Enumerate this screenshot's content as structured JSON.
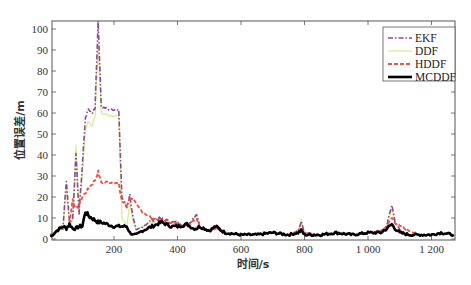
{
  "chart_data": {
    "type": "line",
    "title": "",
    "xlabel": "时间/s",
    "ylabel": "位置误差/m",
    "xlim": [
      0,
      1270
    ],
    "ylim": [
      0,
      104
    ],
    "xticks": [
      200,
      400,
      600,
      800,
      1000,
      1200
    ],
    "xtick_labels": [
      "200",
      "400",
      "600",
      "800",
      "1 000",
      "1 200"
    ],
    "yticks": [
      0,
      10,
      20,
      30,
      40,
      50,
      60,
      70,
      80,
      90,
      100
    ],
    "ytick_labels": [
      "0",
      "10",
      "20",
      "30",
      "40",
      "50",
      "60",
      "70",
      "80",
      "90",
      "100"
    ],
    "grid": false,
    "legend_position": "upper right",
    "x": [
      0,
      20,
      40,
      50,
      60,
      70,
      80,
      90,
      100,
      110,
      120,
      130,
      140,
      150,
      160,
      180,
      200,
      215,
      225,
      240,
      250,
      260,
      270,
      290,
      320,
      350,
      380,
      400,
      430,
      450,
      460,
      470,
      500,
      520,
      550,
      600,
      650,
      700,
      750,
      780,
      790,
      800,
      850,
      900,
      950,
      1000,
      1040,
      1060,
      1075,
      1085,
      1100,
      1130,
      1160,
      1200,
      1230,
      1270
    ],
    "series": [
      {
        "name": "EKF",
        "color": "#8e4a93",
        "style": "dash-dot",
        "values": [
          2,
          4,
          7,
          28,
          8,
          10,
          40,
          12,
          35,
          58,
          62,
          60,
          62,
          104,
          63,
          62,
          62,
          61,
          20,
          15,
          21,
          10,
          4,
          6,
          9,
          10,
          8,
          8,
          6,
          10,
          12,
          6,
          4,
          5,
          3,
          2,
          2,
          3,
          2,
          4,
          8,
          3,
          2,
          3,
          2,
          3,
          3,
          7,
          16,
          9,
          4,
          2,
          2,
          2,
          3,
          2
        ]
      },
      {
        "name": "DDF",
        "color": "#d9ec9a",
        "style": "solid",
        "values": [
          2,
          4,
          6,
          24,
          6,
          9,
          44,
          14,
          30,
          52,
          56,
          54,
          58,
          92,
          60,
          59,
          59,
          58,
          10,
          6,
          18,
          8,
          4,
          6,
          8,
          9,
          8,
          7,
          6,
          10,
          12,
          6,
          4,
          5,
          3,
          2,
          2,
          3,
          2,
          4,
          9,
          3,
          2,
          3,
          2,
          3,
          3,
          7,
          14,
          8,
          4,
          2,
          2,
          2,
          3,
          2
        ]
      },
      {
        "name": "HDDF",
        "color": "#e8534a",
        "style": "dashed",
        "values": [
          2,
          4,
          5,
          6,
          8,
          19,
          14,
          16,
          20,
          22,
          24,
          26,
          28,
          32,
          27,
          27,
          27,
          26,
          18,
          16,
          20,
          19,
          16,
          13,
          10,
          9,
          8,
          7,
          6,
          9,
          10,
          6,
          4,
          5,
          3,
          2,
          2,
          3,
          2,
          4,
          5,
          3,
          2,
          3,
          2,
          3,
          4,
          6,
          10,
          8,
          6,
          4,
          2,
          2,
          3,
          2
        ]
      },
      {
        "name": "MCDDF",
        "color": "#000000",
        "style": "solid-thick",
        "values": [
          1,
          4,
          6,
          5,
          7,
          5,
          5,
          6,
          6,
          13,
          11,
          10,
          9,
          8,
          8,
          7,
          6,
          6,
          6,
          6,
          3,
          2,
          2,
          4,
          6,
          8,
          6,
          6,
          7,
          5,
          5,
          6,
          4,
          6,
          3,
          2,
          2,
          3,
          2,
          3,
          4,
          2,
          2,
          3,
          2,
          3,
          3,
          5,
          7,
          5,
          3,
          2,
          2,
          2,
          3,
          2
        ]
      }
    ]
  }
}
